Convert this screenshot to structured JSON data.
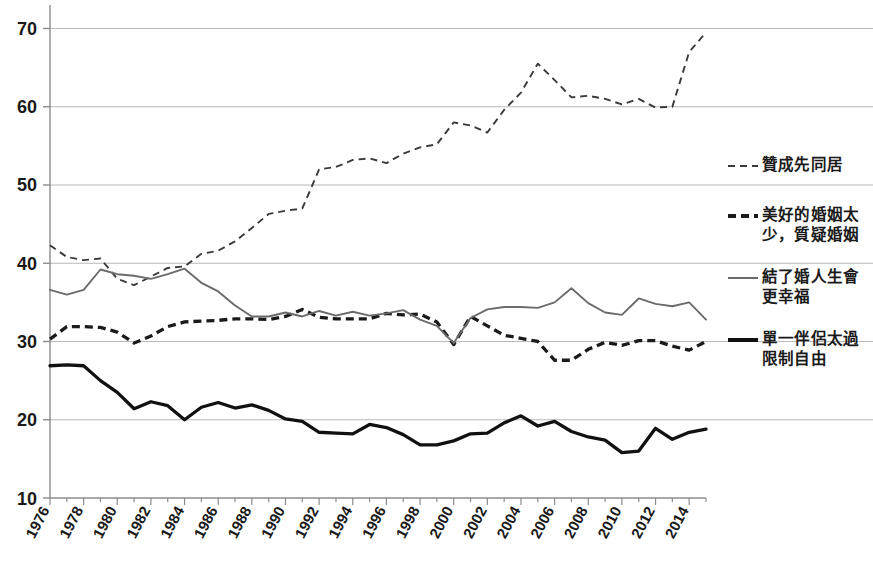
{
  "chart_data": {
    "type": "line",
    "title": "",
    "subtitle": "",
    "xlabel": "",
    "ylabel": "",
    "xlim": [
      1976,
      2015
    ],
    "ylim": [
      10,
      73
    ],
    "yticks": [
      10,
      20,
      30,
      40,
      50,
      60,
      70
    ],
    "grid": true,
    "legend_position": "right",
    "x": [
      1976,
      1977,
      1978,
      1979,
      1980,
      1981,
      1982,
      1983,
      1984,
      1985,
      1986,
      1987,
      1988,
      1989,
      1990,
      1991,
      1992,
      1993,
      1994,
      1995,
      1996,
      1997,
      1998,
      1999,
      2000,
      2001,
      2002,
      2003,
      2004,
      2005,
      2006,
      2007,
      2008,
      2009,
      2010,
      2011,
      2012,
      2013,
      2014,
      2015
    ],
    "xtick_labels": [
      "1976",
      "1978",
      "1980",
      "1982",
      "1984",
      "1986",
      "1988",
      "1990",
      "1992",
      "1994",
      "1996",
      "1998",
      "2000",
      "2002",
      "2004",
      "2006",
      "2008",
      "2010",
      "2012",
      "2014"
    ],
    "series": [
      {
        "name": "贊成先同居",
        "style": "dashed-thin",
        "color": "#3a3a3a",
        "values": [
          42.3,
          40.8,
          40.4,
          40.6,
          38.0,
          37.2,
          38.3,
          39.4,
          39.6,
          41.2,
          41.6,
          42.8,
          44.5,
          46.3,
          46.7,
          47.0,
          52.0,
          52.3,
          53.2,
          53.4,
          52.8,
          54.0,
          54.8,
          55.2,
          58.0,
          57.6,
          56.7,
          59.6,
          61.8,
          65.5,
          63.4,
          61.2,
          61.4,
          61.0,
          60.3,
          61.0,
          59.9,
          60.0,
          67.0,
          69.5
        ]
      },
      {
        "name": "美好的婚姻太少，質疑婚姻",
        "style": "dashed-thick",
        "color": "#1a1a1a",
        "values": [
          30.3,
          31.9,
          31.9,
          31.8,
          31.2,
          29.8,
          30.7,
          31.9,
          32.5,
          32.6,
          32.7,
          32.9,
          32.9,
          32.8,
          33.2,
          34.1,
          33.1,
          32.9,
          32.9,
          32.9,
          33.6,
          33.4,
          33.5,
          32.5,
          29.6,
          33.2,
          32.0,
          30.8,
          30.4,
          30.0,
          27.6,
          27.6,
          29.0,
          29.9,
          29.5,
          30.1,
          30.1,
          29.4,
          28.9,
          30.0
        ]
      },
      {
        "name": "結了婚人生會更幸福",
        "style": "solid-thin",
        "color": "#6b6b6b",
        "values": [
          36.6,
          36.0,
          36.6,
          39.2,
          38.6,
          38.4,
          38.0,
          38.6,
          39.3,
          37.5,
          36.4,
          34.6,
          33.2,
          33.2,
          33.7,
          33.2,
          33.9,
          33.3,
          33.8,
          33.3,
          33.6,
          34.0,
          32.8,
          32.0,
          29.8,
          33.0,
          34.1,
          34.4,
          34.4,
          34.3,
          35.0,
          36.8,
          34.9,
          33.7,
          33.4,
          35.5,
          34.8,
          34.5,
          35.0,
          32.8
        ]
      },
      {
        "name": "單一伴侶太過限制自由",
        "style": "solid-thick",
        "color": "#111111",
        "values": [
          26.9,
          27.0,
          26.9,
          25.0,
          23.5,
          21.4,
          22.3,
          21.8,
          20.0,
          21.6,
          22.2,
          21.5,
          21.9,
          21.2,
          20.1,
          19.8,
          18.4,
          18.3,
          18.2,
          19.4,
          19.0,
          18.1,
          16.8,
          16.8,
          17.3,
          18.2,
          18.3,
          19.6,
          20.5,
          19.2,
          19.8,
          18.5,
          17.8,
          17.4,
          15.8,
          16.0,
          18.9,
          17.5,
          18.4,
          18.8
        ]
      }
    ]
  },
  "legend": {
    "entries": [
      {
        "label": "贊成先同居",
        "style": "dashed-thin"
      },
      {
        "label": "美好的婚姻太\n少，質疑婚姻",
        "style": "dashed-thick"
      },
      {
        "label": "結了婚人生會\n更幸福",
        "style": "solid-thin"
      },
      {
        "label": "單一伴侶太過\n限制自由",
        "style": "solid-thick"
      }
    ]
  },
  "axis": {
    "y_labels": [
      "70",
      "60",
      "50",
      "40",
      "30",
      "20",
      "10"
    ],
    "x_labels": [
      "1976",
      "1978",
      "1980",
      "1982",
      "1984",
      "1986",
      "1988",
      "1990",
      "1992",
      "1994",
      "1996",
      "1998",
      "2000",
      "2002",
      "2004",
      "2006",
      "2008",
      "2010",
      "2012",
      "2014"
    ]
  },
  "colors": {
    "gridline": "#b9b9b9",
    "axis": "#8c8c8c",
    "text": "#1a1a1a",
    "series_gray": "#6b6b6b",
    "series_black": "#111111",
    "background": "#ffffff"
  }
}
